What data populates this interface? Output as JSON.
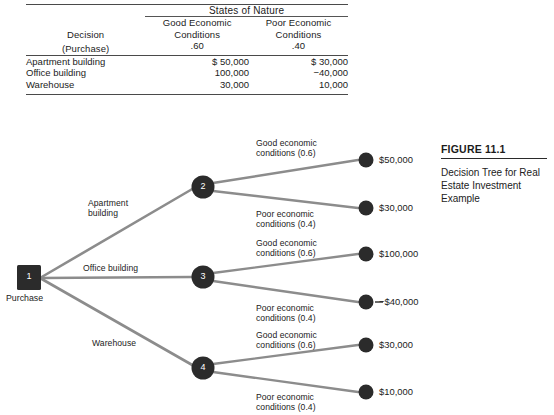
{
  "table": {
    "states_of_nature_header": "States of Nature",
    "decision_header_line1": "Decision",
    "decision_header_line2": "(Purchase)",
    "columns": [
      {
        "line1": "Good Economic",
        "line2": "Conditions",
        "probability": ".60"
      },
      {
        "line1": "Poor Economic",
        "line2": "Conditions",
        "probability": ".40"
      }
    ],
    "rows": [
      {
        "decision": "Apartment building",
        "good": "$  50,000",
        "poor": "$  30,000"
      },
      {
        "decision": "Office building",
        "good": "100,000",
        "poor": "−40,000"
      },
      {
        "decision": "Warehouse",
        "good": "30,000",
        "poor": "10,000"
      }
    ]
  },
  "tree": {
    "root": {
      "number": "1",
      "label": "Purchase"
    },
    "decision_branches": [
      {
        "label": "Apartment\nbuilding"
      },
      {
        "label": "Office building"
      },
      {
        "label": "Warehouse"
      }
    ],
    "chance_nodes": [
      {
        "number": "2"
      },
      {
        "number": "3"
      },
      {
        "number": "4"
      }
    ],
    "outcomes": [
      {
        "label": "Good economic\nconditions (0.6)",
        "payoff": "$50,000"
      },
      {
        "label": "Poor economic\nconditions (0.4)",
        "payoff": "$30,000"
      },
      {
        "label": "Good economic\nconditions (0.6)",
        "payoff": "$100,000"
      },
      {
        "label": "Poor economic\nconditions (0.4)",
        "payoff": "−$40,000"
      },
      {
        "label": "Good economic\nconditions (0.6)",
        "payoff": "$30,000"
      },
      {
        "label": "Poor economic\nconditions (0.4)",
        "payoff": "$10,000"
      }
    ]
  },
  "figure": {
    "number": "FIGURE 11.1",
    "description": "Decision Tree for\nReal Estate\nInvestment Example"
  },
  "colors": {
    "node_fill": "#2b2b2b",
    "branch_line": "#8c8c8c",
    "text": "#1b1b1b",
    "rule": "#4a4a4a"
  }
}
